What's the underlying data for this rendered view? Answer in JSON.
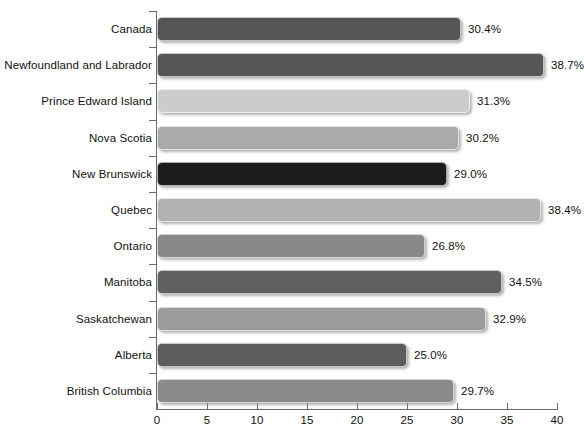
{
  "chart_data": {
    "type": "bar",
    "orientation": "horizontal",
    "title": "",
    "subtitle": "",
    "xlabel": "",
    "ylabel": "",
    "xlim": [
      0,
      40
    ],
    "xticks": [
      0,
      5,
      10,
      15,
      20,
      25,
      30,
      35,
      40
    ],
    "xtick_labels": [
      "0",
      "5",
      "10",
      "15",
      "20",
      "25",
      "30",
      "35",
      "40"
    ],
    "grid": false,
    "legend": false,
    "value_label_suffix": "%",
    "categories": [
      "Canada",
      "Newfoundland and Labrador",
      "Prince Edward Island",
      "Nova Scotia",
      "New Brunswick",
      "Quebec",
      "Ontario",
      "Manitoba",
      "Saskatchewan",
      "Alberta",
      "British Columbia"
    ],
    "values": [
      30.4,
      38.7,
      31.3,
      30.2,
      29.0,
      38.4,
      26.8,
      34.5,
      32.9,
      25.0,
      29.7
    ],
    "value_labels": [
      "30.4%",
      "38.7%",
      "31.3%",
      "30.2%",
      "29.0%",
      "38.4%",
      "26.8%",
      "34.5%",
      "32.9%",
      "25.0%",
      "29.7%"
    ],
    "bar_colors": [
      "#555555",
      "#565656",
      "#cccccc",
      "#aaaaaa",
      "#1c1c1c",
      "#b2b2b2",
      "#888888",
      "#606060",
      "#9b9b9b",
      "#5c5c5c",
      "#8b8b8b"
    ],
    "bars": [
      {
        "category": "Canada",
        "value": 30.4,
        "label": "30.4%",
        "color": "#555555"
      },
      {
        "category": "Newfoundland and Labrador",
        "value": 38.7,
        "label": "38.7%",
        "color": "#565656"
      },
      {
        "category": "Prince Edward Island",
        "value": 31.3,
        "label": "31.3%",
        "color": "#cccccc"
      },
      {
        "category": "Nova Scotia",
        "value": 30.2,
        "label": "30.2%",
        "color": "#aaaaaa"
      },
      {
        "category": "New Brunswick",
        "value": 29.0,
        "label": "29.0%",
        "color": "#1c1c1c"
      },
      {
        "category": "Quebec",
        "value": 38.4,
        "label": "38.4%",
        "color": "#b2b2b2"
      },
      {
        "category": "Ontario",
        "value": 26.8,
        "label": "26.8%",
        "color": "#888888"
      },
      {
        "category": "Manitoba",
        "value": 34.5,
        "label": "34.5%",
        "color": "#606060"
      },
      {
        "category": "Saskatchewan",
        "value": 32.9,
        "label": "32.9%",
        "color": "#9b9b9b"
      },
      {
        "category": "Alberta",
        "value": 25.0,
        "label": "25.0%",
        "color": "#5c5c5c"
      },
      {
        "category": "British Columbia",
        "value": 29.7,
        "label": "29.7%",
        "color": "#8b8b8b"
      }
    ],
    "axis_color": "#6a6a6a",
    "background_color": "#ffffff",
    "text_color": "#101010"
  }
}
